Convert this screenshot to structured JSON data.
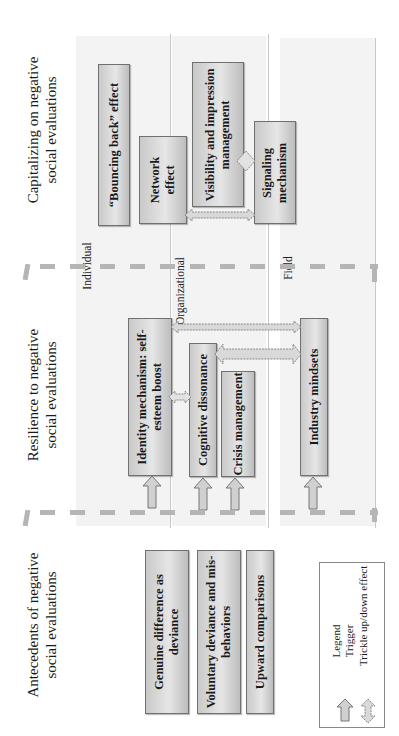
{
  "sections": {
    "capitalizing": {
      "title_line1": "Capitalizing on negative",
      "title_line2": "social evaluations"
    },
    "resilience": {
      "title_line1": "Resilience to negative",
      "title_line2": "social evaluations"
    },
    "antecedents": {
      "title_line1": "Antecedents of negative",
      "title_line2": "social evaluations"
    }
  },
  "levels": {
    "individual": "Individual",
    "organizational": "Organizational",
    "field": "Field"
  },
  "boxes": {
    "bouncing_back": "“Bouncing back” effect",
    "network_line1": "Network",
    "network_line2": "effect",
    "visibility_line1": "Visibility and impression",
    "visibility_line2": "management",
    "signaling_line1": "Signaling",
    "signaling_line2": "mechanism",
    "identity_line1": "Identity mechanism: self-",
    "identity_line2": "esteem boost",
    "cognitive": "Cognitive dissonance",
    "crisis": "Crisis management",
    "industry": "Industry mindsets",
    "genuine_line1": "Genuine difference as",
    "genuine_line2": "deviance",
    "voluntary_line1": "Voluntary deviance and mis-",
    "voluntary_line2": "behaviors",
    "upward": "Upward comparisons"
  },
  "legend": {
    "title": "Legend",
    "trigger": "Trigger",
    "trickle": "Trickle up/down effect"
  },
  "colors": {
    "band": "#f3f3f3",
    "box_border": "#707070",
    "dash": "#b5b5b5",
    "arrow_fill": "#d0d0d0"
  }
}
